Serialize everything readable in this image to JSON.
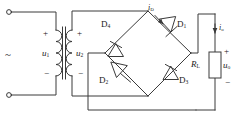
{
  "diagram": {
    "stroke_color": "#3a3a3a",
    "text_color": "#1a1a1a",
    "background": "#ffffff"
  },
  "source": {
    "symbol": "~",
    "terminal_top_name": "ac-terminal-top",
    "terminal_bottom_name": "ac-terminal-bottom"
  },
  "transformer": {
    "primary": {
      "label": "u",
      "subscript": "1",
      "plus": "+",
      "minus": "−"
    },
    "secondary": {
      "label": "u",
      "subscript": "2",
      "plus": "+",
      "minus": "−"
    }
  },
  "bridge": {
    "diodes": [
      {
        "label": "D",
        "subscript": "1",
        "position": "upper-right"
      },
      {
        "label": "D",
        "subscript": "2",
        "position": "lower-left"
      },
      {
        "label": "D",
        "subscript": "3",
        "position": "lower-right"
      },
      {
        "label": "D",
        "subscript": "4",
        "position": "upper-left"
      }
    ],
    "diode_current": {
      "label": "i",
      "subscript": "D"
    }
  },
  "load": {
    "resistor": {
      "label": "R",
      "subscript": "L"
    },
    "voltage": {
      "label": "u",
      "subscript": "o",
      "plus": "+",
      "minus": "−"
    },
    "current": {
      "label": "i",
      "subscript": "o"
    }
  }
}
